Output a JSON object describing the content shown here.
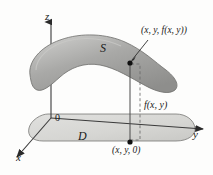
{
  "figure": {
    "caption_type": "3d-surface-over-domain-diagram",
    "background_color": "#fdfdfc"
  },
  "axes": {
    "z": {
      "label": "z",
      "direction": "up"
    },
    "y": {
      "label": "y",
      "direction": "right"
    },
    "x": {
      "label": "x",
      "direction": "down-left"
    },
    "origin_label": "0"
  },
  "surface": {
    "label": "S",
    "fill_color": "#a9a9a7",
    "edge_color": "#6f6f6d",
    "highlight_color": "#c3c3c1"
  },
  "domain": {
    "label": "D",
    "fill_color": "#d9d9d6",
    "edge_color": "#6f6f6d"
  },
  "points": {
    "top": {
      "label": "(x, y, f(x, y))",
      "marker": "filled-dot"
    },
    "base": {
      "label": "(x, y, 0)",
      "marker": "filled-dot"
    }
  },
  "height_measure": {
    "label": "f(x, y)",
    "style": "dashed-bracket"
  },
  "colors": {
    "ink": "#1a1a1a",
    "line": "#3a3a3a",
    "dashed": "#6a6a6a"
  }
}
